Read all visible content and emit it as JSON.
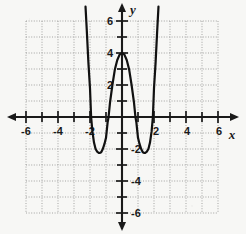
{
  "figure": {
    "kind": "cartesian-graph",
    "axis_label_x": "x",
    "axis_label_y": "y",
    "ink_color": "#1a1a1a",
    "grid_color": "#8f8f8f",
    "background_color": "#f7f7f5"
  },
  "chart_data": {
    "type": "line",
    "title": "",
    "xlabel": "x",
    "ylabel": "y",
    "xlim": [
      -6.8,
      6.8
    ],
    "ylim": [
      -6.8,
      6.8
    ],
    "grid": true,
    "grid_style": "dotted",
    "grid_spacing": 1,
    "legend": "none",
    "x_ticks": [
      -6,
      -5,
      -4,
      -3,
      -2,
      -1,
      1,
      2,
      3,
      4,
      5,
      6
    ],
    "x_tick_labels": [
      "-6",
      "",
      "-4",
      "",
      "-2",
      "",
      "",
      "2",
      "",
      "4",
      "",
      "6"
    ],
    "y_ticks": [
      -6,
      -5,
      -4,
      -3,
      -2,
      -1,
      1,
      2,
      3,
      4,
      5,
      6
    ],
    "y_tick_labels": [
      "-6",
      "",
      "-4",
      "",
      "-2",
      "",
      "",
      "2",
      "",
      "4",
      "",
      "6"
    ],
    "x_labeled": [
      "-6",
      "-4",
      "-2",
      "2",
      "4",
      "6"
    ],
    "y_labeled": [
      "6",
      "4",
      "2",
      "-2",
      "-4",
      "-6"
    ],
    "series": [
      {
        "name": "quartic curve",
        "description": "W-shaped quartic with local maximum at (0, 4) and two local minima near (-1.4, -2.25) and (1.4, -2.25)",
        "local_maximum": [
          0,
          4
        ],
        "local_minima": [
          [
            -1.4,
            -2.25
          ],
          [
            1.4,
            -2.25
          ]
        ],
        "x_intercepts": [
          -1.93,
          -0.84,
          0.84,
          1.93
        ],
        "y_intercept": 4,
        "points": [
          [
            -2.28,
            6.9
          ],
          [
            -2.2,
            5.4
          ],
          [
            -2.1,
            3.4
          ],
          [
            -2.0,
            1.8
          ],
          [
            -1.93,
            0.0
          ],
          [
            -1.85,
            -0.9
          ],
          [
            -1.75,
            -1.6
          ],
          [
            -1.65,
            -2.0
          ],
          [
            -1.55,
            -2.17
          ],
          [
            -1.45,
            -2.25
          ],
          [
            -1.4,
            -2.25
          ],
          [
            -1.3,
            -2.2
          ],
          [
            -1.2,
            -2.0
          ],
          [
            -1.1,
            -1.7
          ],
          [
            -1.0,
            -1.3
          ],
          [
            -0.9,
            -0.35
          ],
          [
            -0.84,
            0.0
          ],
          [
            -0.75,
            0.9
          ],
          [
            -0.6,
            2.0
          ],
          [
            -0.45,
            2.95
          ],
          [
            -0.3,
            3.55
          ],
          [
            -0.15,
            3.9
          ],
          [
            0.0,
            4.0
          ],
          [
            0.15,
            3.9
          ],
          [
            0.3,
            3.55
          ],
          [
            0.45,
            2.95
          ],
          [
            0.6,
            2.0
          ],
          [
            0.75,
            0.9
          ],
          [
            0.84,
            0.0
          ],
          [
            0.9,
            -0.35
          ],
          [
            1.0,
            -1.3
          ],
          [
            1.1,
            -1.7
          ],
          [
            1.2,
            -2.0
          ],
          [
            1.3,
            -2.2
          ],
          [
            1.4,
            -2.25
          ],
          [
            1.45,
            -2.25
          ],
          [
            1.55,
            -2.17
          ],
          [
            1.65,
            -2.0
          ],
          [
            1.75,
            -1.6
          ],
          [
            1.85,
            -0.9
          ],
          [
            1.93,
            0.0
          ],
          [
            2.0,
            1.8
          ],
          [
            2.1,
            3.4
          ],
          [
            2.2,
            5.4
          ],
          [
            2.28,
            6.9
          ]
        ]
      }
    ]
  },
  "labels": {
    "x_neg6": "-6",
    "x_neg4": "-4",
    "x_neg2": "-2",
    "x_pos2": "2",
    "x_pos4": "4",
    "x_pos6": "6",
    "y_pos6": "6",
    "y_pos4": "4",
    "y_pos2": "2",
    "y_neg2": "-2",
    "y_neg4": "-4",
    "y_neg6": "-6",
    "axis_x": "x",
    "axis_y": "y"
  }
}
